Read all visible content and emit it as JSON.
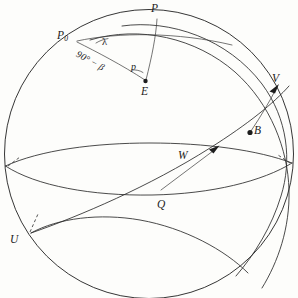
{
  "figure": {
    "kind": "celestial-sphere-diagram",
    "background_color": "#fdfdfb",
    "line_color": "#2b2b2b",
    "width": 298,
    "height": 298
  },
  "labels": {
    "pole_P": "P",
    "pole_P0": "P",
    "pole_P0_subscript": "0",
    "point_E": "E",
    "point_V": "V",
    "point_B": "B",
    "vector_W": "W",
    "point_Q": "Q",
    "point_U": "U",
    "angle_lambda": "λ",
    "angle_p": "p",
    "arc_codeclination": "90° − β",
    "arc_codeclination_number": "90",
    "arc_codeclination_degree": "°",
    "arc_codeclination_minus": "−",
    "arc_codeclination_symbol": "β"
  },
  "elements": {
    "sphere_outline": "great-circle-silhouette",
    "equator": "horizontal-great-circle",
    "ecliptic": "inclined-great-circle-U-Q-V",
    "meridian_through_P": "meridian-arc",
    "meridian_through_P0": "meridian-arc",
    "arc_P_to_E": "great-circle-arc",
    "arc_P0_to_E": "great-circle-arc",
    "arc_B_to_V": "great-circle-arc",
    "tick_left": "dashed-tick",
    "tick_right": "dashed-tick",
    "tick_near_U": "dashed-tick",
    "arrowhead_V": "arrowhead",
    "arrowhead_W": "arrowhead",
    "dot_E": "filled-point",
    "dot_B": "filled-point"
  }
}
